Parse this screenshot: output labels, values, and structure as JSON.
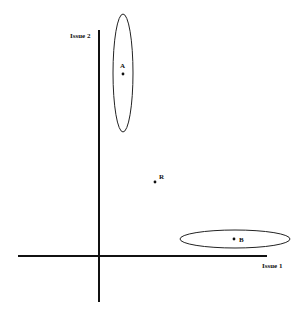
{
  "diagram": {
    "axes": {
      "x_label": "Issue 1",
      "y_label": "Issue 2"
    },
    "points": [
      {
        "id": "A",
        "label": "A"
      },
      {
        "id": "R",
        "label": "R"
      },
      {
        "id": "B",
        "label": "B"
      }
    ],
    "colors": {
      "ink": "#111111",
      "background": "#ffffff"
    }
  }
}
